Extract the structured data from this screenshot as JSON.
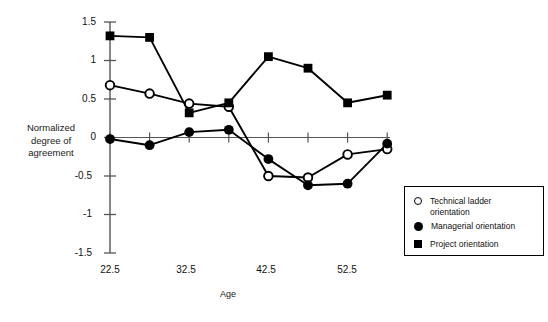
{
  "chart_data": {
    "type": "line",
    "title": "",
    "xlabel": "Age",
    "ylabel": "Normalized degree of agreement",
    "x": [
      22.5,
      27.5,
      32.5,
      37.5,
      42.5,
      47.5,
      52.5,
      57.5
    ],
    "xtick_labels": [
      "22.5",
      "32.5",
      "42.5",
      "52.5"
    ],
    "xtick_values": [
      22.5,
      32.5,
      42.5,
      52.5
    ],
    "ytick_labels": [
      "1.5",
      "1",
      "0.5",
      "0",
      "-0.5",
      "-1",
      "-1.5"
    ],
    "ytick_values": [
      1.5,
      1,
      0.5,
      0,
      -0.5,
      -1,
      -1.5
    ],
    "xlim": [
      22.5,
      57.5
    ],
    "ylim": [
      -1.5,
      1.5
    ],
    "grid": false,
    "legend_position": "bottom-right",
    "series": [
      {
        "name": "Technical ladder orientation",
        "marker": "open-circle",
        "values": [
          0.68,
          0.57,
          0.44,
          0.4,
          -0.5,
          -0.52,
          -0.22,
          -0.15
        ]
      },
      {
        "name": "Managerial orientation",
        "marker": "filled-circle",
        "values": [
          -0.02,
          -0.1,
          0.07,
          0.1,
          -0.28,
          -0.62,
          -0.6,
          -0.08
        ]
      },
      {
        "name": "Project orientation",
        "marker": "filled-square",
        "values": [
          1.32,
          1.3,
          0.32,
          0.45,
          1.05,
          0.9,
          0.45,
          0.55
        ]
      }
    ]
  },
  "axis": {
    "y_title_line1": "Normalized",
    "y_title_line2": "degree of",
    "y_title_line3": "agreement",
    "x_title": "Age",
    "ytick_0": "1.5",
    "ytick_1": "1",
    "ytick_2": "0.5",
    "ytick_3": "0",
    "ytick_4": "-0.5",
    "ytick_5": "-1",
    "ytick_6": "-1.5",
    "xtick_0": "22.5",
    "xtick_1": "32.5",
    "xtick_2": "42.5",
    "xtick_3": "52.5"
  },
  "legend": {
    "items": [
      {
        "marker": "open-circle",
        "line1": "Technical ladder",
        "line2": "orientation",
        "label": "Technical ladder orientation"
      },
      {
        "marker": "filled-circle",
        "line1": "Managerial orientation",
        "line2": "",
        "label": "Managerial orientation"
      },
      {
        "marker": "filled-square",
        "line1": "Project orientation",
        "line2": "",
        "label": "Project orientation"
      }
    ]
  },
  "colors": {
    "ink": "#000000",
    "axis": "#555555",
    "background": "#ffffff"
  }
}
